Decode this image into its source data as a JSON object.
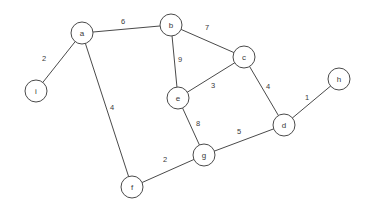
{
  "chart_data": {
    "type": "diagram",
    "subtype": "weighted-undirected-graph",
    "title": "",
    "background_color": "#ffffff",
    "node_stroke_color": "#4a4a4a",
    "node_fill_color": "#ffffff",
    "edge_color": "#4a4a4a",
    "label_color": "#3a3a3a",
    "node_radius": 11,
    "nodes": [
      {
        "id": "a",
        "label": "a",
        "x": 82,
        "y": 33
      },
      {
        "id": "b",
        "label": "b",
        "x": 171,
        "y": 25
      },
      {
        "id": "c",
        "label": "c",
        "x": 244,
        "y": 57
      },
      {
        "id": "d",
        "label": "d",
        "x": 284,
        "y": 125
      },
      {
        "id": "e",
        "label": "e",
        "x": 178,
        "y": 98
      },
      {
        "id": "f",
        "label": "f",
        "x": 132,
        "y": 187
      },
      {
        "id": "g",
        "label": "g",
        "x": 204,
        "y": 155
      },
      {
        "id": "h",
        "label": "h",
        "x": 339,
        "y": 79
      },
      {
        "id": "i",
        "label": "i",
        "x": 36,
        "y": 91
      }
    ],
    "edges": [
      {
        "source": "a",
        "target": "b",
        "weight": 6,
        "label_x": 123,
        "label_y": 21
      },
      {
        "source": "a",
        "target": "i",
        "weight": 2,
        "label_x": 44,
        "label_y": 58
      },
      {
        "source": "a",
        "target": "f",
        "weight": 4,
        "label_x": 112,
        "label_y": 107
      },
      {
        "source": "b",
        "target": "c",
        "weight": 7,
        "label_x": 207,
        "label_y": 27
      },
      {
        "source": "b",
        "target": "e",
        "weight": 9,
        "label_x": 180,
        "label_y": 59
      },
      {
        "source": "c",
        "target": "e",
        "weight": 3,
        "label_x": 213,
        "label_y": 85
      },
      {
        "source": "c",
        "target": "d",
        "weight": 4,
        "label_x": 268,
        "label_y": 86
      },
      {
        "source": "d",
        "target": "h",
        "weight": 1,
        "label_x": 307,
        "label_y": 97
      },
      {
        "source": "d",
        "target": "g",
        "weight": 5,
        "label_x": 239,
        "label_y": 131
      },
      {
        "source": "e",
        "target": "g",
        "weight": 8,
        "label_x": 198,
        "label_y": 123
      },
      {
        "source": "f",
        "target": "g",
        "weight": 2,
        "label_x": 165,
        "label_y": 159
      }
    ],
    "node_ids": [
      "a",
      "b",
      "c",
      "d",
      "e",
      "f",
      "g",
      "h",
      "i"
    ],
    "weights": [
      6,
      2,
      4,
      7,
      9,
      3,
      4,
      1,
      5,
      8,
      2
    ],
    "node_count": 9,
    "edge_count": 11
  }
}
